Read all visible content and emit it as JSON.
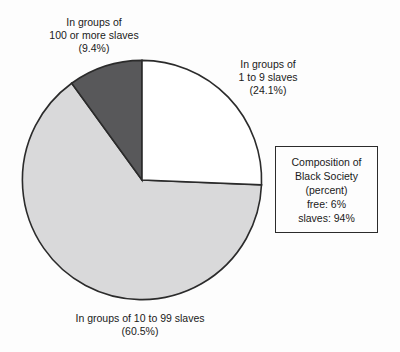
{
  "chart_data": {
    "type": "pie",
    "title": "",
    "categories": [
      "In groups of 1 to 9 slaves",
      "In groups of 10 to 99 slaves",
      "In groups of 100 or more slaves"
    ],
    "values": [
      24.1,
      60.5,
      9.4
    ],
    "value_unit": "percent",
    "slice_colors": [
      "#ffffff",
      "#d9d9da",
      "#58585a"
    ],
    "start_angle_deg": 0,
    "direction": "clockwise",
    "grid": false,
    "legend_position": "right",
    "annotations": [
      "Composition of Black Society (percent)",
      "free: 6%",
      "slaves: 94%"
    ]
  },
  "labels": {
    "large_groups": {
      "line1": "In groups of",
      "line2": "100 or more slaves",
      "line3": "(9.4%)"
    },
    "small_groups": {
      "line1": "In groups of",
      "line2": "1 to 9 slaves",
      "line3": "(24.1%)"
    },
    "mid_groups": {
      "line1": "In groups of 10 to 99 slaves",
      "line2": "(60.5%)"
    }
  },
  "legend": {
    "line1": "Composition of",
    "line2": "Black Society",
    "line3": "(percent)",
    "line4": "free: 6%",
    "line5": "slaves: 94%"
  },
  "colors": {
    "slice_small": "#ffffff",
    "slice_mid": "#d9d9da",
    "slice_large": "#58585a",
    "outline": "#2b2b2b",
    "text": "#1a1a1a",
    "background": "#fdfdfd"
  }
}
